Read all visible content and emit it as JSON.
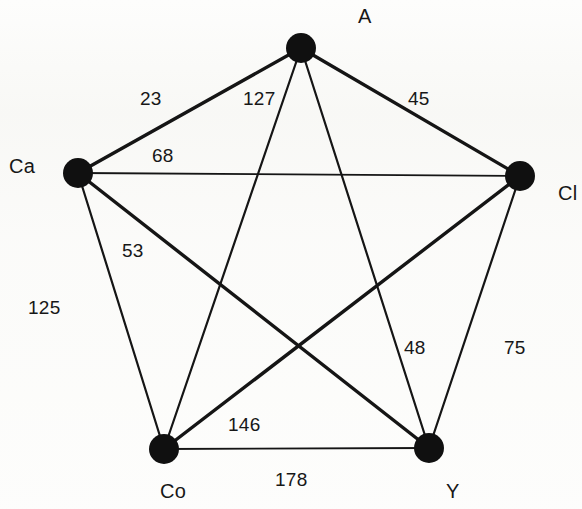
{
  "figure": {
    "corner_mark": ")",
    "background_color": "#fdfdfc",
    "ink_color": "#151515"
  },
  "chart_data": {
    "type": "diagram",
    "diagram_kind": "weighted-complete-graph",
    "title": "",
    "node_count": 5,
    "edge_count": 10,
    "nodes": [
      {
        "id": "A",
        "label": "A",
        "x": 301,
        "y": 48,
        "r": 15,
        "label_x": 358,
        "label_y": 5
      },
      {
        "id": "Ca",
        "label": "Ca",
        "x": 78,
        "y": 173,
        "r": 15,
        "label_x": 9,
        "label_y": 155
      },
      {
        "id": "Cl",
        "label": "Cl",
        "x": 520,
        "y": 176,
        "r": 15,
        "label_x": 558,
        "label_y": 182
      },
      {
        "id": "Co",
        "label": "Co",
        "x": 164,
        "y": 449,
        "r": 15,
        "label_x": 160,
        "label_y": 480
      },
      {
        "id": "Y",
        "label": "Y",
        "x": 429,
        "y": 448,
        "r": 15,
        "label_x": 446,
        "label_y": 480
      }
    ],
    "edges": [
      {
        "from": "A",
        "to": "Ca",
        "weight": 23,
        "label": "23",
        "label_x": 140,
        "label_y": 88,
        "stroke": 3.4
      },
      {
        "from": "A",
        "to": "Co",
        "weight": 127,
        "label": "127",
        "label_x": 243,
        "label_y": 88,
        "stroke": 2.2
      },
      {
        "from": "A",
        "to": "Cl",
        "weight": 45,
        "label": "45",
        "label_x": 408,
        "label_y": 88,
        "stroke": 3.4
      },
      {
        "from": "Ca",
        "to": "Cl",
        "weight": 68,
        "label": "68",
        "label_x": 152,
        "label_y": 145,
        "stroke": 1.8
      },
      {
        "from": "Ca",
        "to": "Y",
        "weight": 53,
        "label": "53",
        "label_x": 122,
        "label_y": 240,
        "stroke": 3.4
      },
      {
        "from": "Ca",
        "to": "Co",
        "weight": 125,
        "label": "125",
        "label_x": 28,
        "label_y": 297,
        "stroke": 2.2
      },
      {
        "from": "A",
        "to": "Y",
        "weight": 48,
        "label": "48",
        "label_x": 404,
        "label_y": 337,
        "stroke": 2.2
      },
      {
        "from": "Cl",
        "to": "Y",
        "weight": 75,
        "label": "75",
        "label_x": 504,
        "label_y": 337,
        "stroke": 2.2
      },
      {
        "from": "Cl",
        "to": "Co",
        "weight": 146,
        "label": "146",
        "label_x": 228,
        "label_y": 414,
        "stroke": 3.4
      },
      {
        "from": "Co",
        "to": "Y",
        "weight": 178,
        "label": "178",
        "label_x": 275,
        "label_y": 469,
        "stroke": 1.8
      }
    ],
    "edge_weight_matrix": {
      "labels": [
        "A",
        "Ca",
        "Cl",
        "Co",
        "Y"
      ],
      "rows": [
        [
          null,
          23,
          45,
          127,
          48
        ],
        [
          23,
          null,
          68,
          125,
          53
        ],
        [
          45,
          68,
          null,
          146,
          75
        ],
        [
          127,
          125,
          146,
          null,
          178
        ],
        [
          48,
          53,
          75,
          178,
          null
        ]
      ]
    }
  }
}
